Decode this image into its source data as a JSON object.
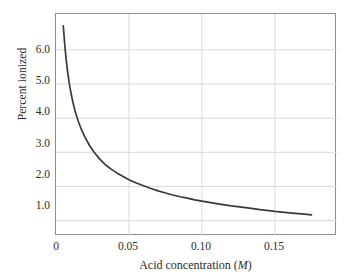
{
  "chart_data": {
    "type": "line",
    "title": "",
    "subtitle": "",
    "xlabel": "Acid concentration (M)",
    "xlabel_text": "Acid concentration (",
    "xlabel_unit": "M",
    "xlabel_close": ")",
    "ylabel": "Percent ionized",
    "xlim": [
      0.0,
      0.1925
    ],
    "ylim": [
      0.55,
      7.05
    ],
    "xticks": [
      0,
      0.05,
      0.1,
      0.15
    ],
    "xtick_labels": [
      "0",
      "0.05",
      "0.10",
      "0.15"
    ],
    "yticks": [
      1.0,
      2.0,
      3.0,
      4.0,
      5.0,
      6.0
    ],
    "ytick_labels": [
      "1.0",
      "2.0",
      "3.0",
      "4.0",
      "5.0",
      "6.0"
    ],
    "grid": true,
    "grid_axis": "both",
    "legend": false,
    "legend_position": "none",
    "series": [
      {
        "name": "Percent ionized vs acid concentration",
        "color": "#3a3a3a",
        "line_width": 1.7,
        "x": [
          0.005,
          0.006,
          0.007,
          0.008,
          0.009,
          0.01,
          0.0115,
          0.013,
          0.015,
          0.017,
          0.02,
          0.023,
          0.026,
          0.03,
          0.034,
          0.038,
          0.042,
          0.046,
          0.05,
          0.055,
          0.06,
          0.065,
          0.07,
          0.075,
          0.08,
          0.085,
          0.09,
          0.095,
          0.1,
          0.11,
          0.12,
          0.13,
          0.14,
          0.15,
          0.16,
          0.17,
          0.175
        ],
        "y": [
          6.7,
          6.15,
          5.7,
          5.35,
          5.05,
          4.8,
          4.48,
          4.22,
          3.94,
          3.71,
          3.43,
          3.2,
          3.01,
          2.8,
          2.63,
          2.5,
          2.39,
          2.29,
          2.2,
          2.1,
          2.02,
          1.94,
          1.87,
          1.81,
          1.75,
          1.7,
          1.66,
          1.61,
          1.57,
          1.5,
          1.43,
          1.38,
          1.32,
          1.27,
          1.23,
          1.19,
          1.17
        ]
      }
    ]
  },
  "axes": {
    "frame_color": "#8d8d8d",
    "grid_color": "#d8d8d8",
    "background": "#ffffff"
  }
}
